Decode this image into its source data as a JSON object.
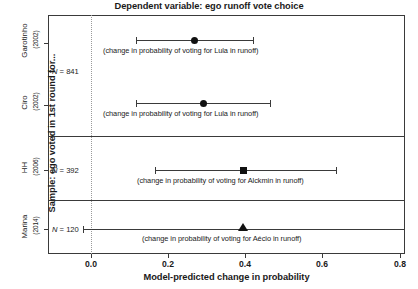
{
  "chart_data": {
    "type": "scatter",
    "title": "Dependent variable: ego runoff vote choice",
    "xlabel": "Model-predicted change in probability",
    "ylabel": "Sample: ego voted in 1st round for...",
    "xlim": [
      -0.11,
      0.815
    ],
    "ylim": [
      0,
      4
    ],
    "grid": false,
    "legend": "none",
    "xticks": [
      0.0,
      0.2,
      0.4,
      0.6,
      0.8
    ],
    "xticklabels": [
      "0.0",
      "0.2",
      "0.4",
      "0.6",
      "0.8"
    ],
    "reference_line_x": 0.0,
    "categories": [
      "Garotinho",
      "Ciro",
      "HH",
      "Marina"
    ],
    "points": [
      {
        "group": "Garotinho",
        "group_year": "(2002)",
        "n_label": "N = 841",
        "n": 841,
        "estimate": 0.268,
        "ci_low": 0.117,
        "ci_high": 0.421,
        "marker": "circle",
        "annotation": "(change in probability of voting for Lula in runoff)"
      },
      {
        "group": "Ciro",
        "group_year": "(2002)",
        "n_label": "N = 841",
        "n": 841,
        "estimate": 0.291,
        "ci_low": 0.117,
        "ci_high": 0.465,
        "marker": "circle",
        "annotation": "(change in probability of voting for Lula in runoff)"
      },
      {
        "group": "HH",
        "group_year": "(2006)",
        "n_label": "N = 392",
        "n": 392,
        "estimate": 0.395,
        "ci_low": 0.166,
        "ci_high": 0.636,
        "marker": "square",
        "annotation": "(change in probability of voting for Alckmin in runoff)"
      },
      {
        "group": "Marina",
        "group_year": "(2014)",
        "n_label": "N = 120",
        "n": 120,
        "estimate": 0.395,
        "ci_low": -0.021,
        "ci_high": 0.813,
        "marker": "triangle",
        "annotation": "(change in probability of voting for Aécio in runoff)"
      }
    ]
  },
  "colors": {
    "frame": "#3a3a3a",
    "marker": "#111111",
    "reference_line": "#9a9a9a",
    "background": "#ffffff"
  }
}
